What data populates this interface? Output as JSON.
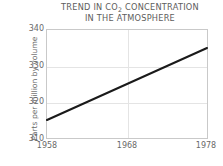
{
  "chart_data": {
    "type": "line",
    "title": "TREND IN CO2 CONCENTRATION IN THE ATMOSPHERE",
    "title_line1_prefix": "TREND IN CO",
    "title_line1_sub": "2",
    "title_line1_suffix": " CONCENTRATION",
    "title_line2": "IN THE ATMOSPHERE",
    "xlabel": "",
    "ylabel": "Parts per million by volume",
    "x": [
      1958,
      1978
    ],
    "values": [
      315,
      335
    ],
    "series": [
      {
        "name": "CO2 concentration",
        "values": [
          315,
          335
        ]
      }
    ],
    "xlim": [
      1958,
      1978
    ],
    "ylim": [
      310,
      340
    ],
    "x_ticks": [
      1958,
      1968,
      1978
    ],
    "x_tick_labels": [
      "1958",
      "1968",
      "1978"
    ],
    "y_ticks": [
      310,
      320,
      330,
      340
    ],
    "y_tick_labels": [
      "310",
      "320",
      "330",
      "340"
    ],
    "grid": true,
    "legend": false,
    "legend_position": "none",
    "line_color": "#1a1a1a",
    "grid_color": "#e4e4e4",
    "frame_color": "#c9c9c9",
    "text_color": "#6a6a6a",
    "background_color": "#ffffff"
  }
}
